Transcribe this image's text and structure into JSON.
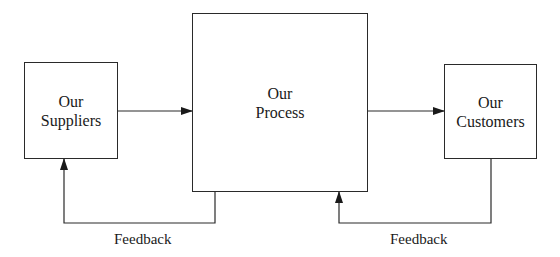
{
  "diagram": {
    "type": "process flow with feedback loops",
    "nodes": [
      {
        "id": "suppliers",
        "line1": "Our",
        "line2": "Suppliers"
      },
      {
        "id": "process",
        "line1": "Our",
        "line2": "Process"
      },
      {
        "id": "customers",
        "line1": "Our",
        "line2": "Customers"
      }
    ],
    "edges": [
      {
        "from": "suppliers",
        "to": "process",
        "label": ""
      },
      {
        "from": "process",
        "to": "customers",
        "label": ""
      },
      {
        "from": "process",
        "to": "suppliers",
        "label": "Feedback"
      },
      {
        "from": "customers",
        "to": "process",
        "label": "Feedback"
      }
    ],
    "feedback_left_label": "Feedback",
    "feedback_right_label": "Feedback",
    "colors": {
      "line": "#2a2a2a",
      "background": "#ffffff"
    }
  }
}
